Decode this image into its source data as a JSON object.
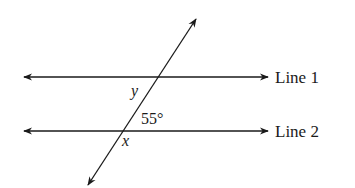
{
  "diagram": {
    "type": "parallel-lines-transversal",
    "lines": [
      {
        "id": "line1",
        "label": "Line 1"
      },
      {
        "id": "line2",
        "label": "Line 2"
      }
    ],
    "angles": {
      "given": "55°",
      "unknown_y": "y",
      "unknown_x": "x"
    },
    "colors": {
      "stroke": "#1a1a1a",
      "background": "#ffffff"
    }
  }
}
